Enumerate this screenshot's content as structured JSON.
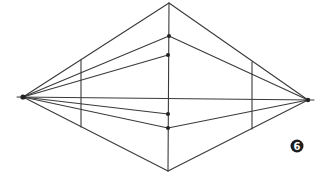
{
  "figure": {
    "type": "two-point perspective construction",
    "step_label": "6",
    "vanishing_points": {
      "left": {
        "x": 23,
        "y": 97
      },
      "right": {
        "x": 308,
        "y": 100
      }
    },
    "center_vertical": {
      "x_top": 169,
      "y_top": 3,
      "x_bottom": 168,
      "y_bottom": 171
    },
    "center_dots": [
      {
        "x": 169,
        "y": 36
      },
      {
        "x": 168,
        "y": 55
      },
      {
        "x": 168,
        "y": 114
      },
      {
        "x": 168,
        "y": 128
      }
    ],
    "left_vertical": {
      "x": 81,
      "y_top": 60,
      "y_bottom": 127
    },
    "right_vertical": {
      "x": 252,
      "y_top": 62,
      "y_bottom": 129
    },
    "badge": {
      "x": 297,
      "y": 146,
      "r": 6.5
    }
  }
}
